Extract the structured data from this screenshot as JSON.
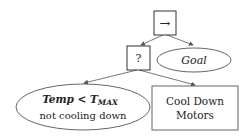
{
  "diagram": {
    "type": "behavior-tree",
    "nodes": {
      "sequence": {
        "label": "→",
        "shape": "box"
      },
      "selector": {
        "label": "?",
        "shape": "box"
      },
      "goal": {
        "label": "Goal",
        "shape": "ellipse"
      },
      "condition": {
        "line1": "Temp < T",
        "subscript": "MAX",
        "line2": "not cooling down",
        "shape": "ellipse"
      },
      "action": {
        "line1": "Cool Down",
        "line2": "Motors",
        "shape": "box"
      }
    },
    "edges": [
      {
        "from": "sequence",
        "to": "selector"
      },
      {
        "from": "sequence",
        "to": "goal"
      },
      {
        "from": "selector",
        "to": "condition"
      },
      {
        "from": "selector",
        "to": "action"
      }
    ],
    "colors": {
      "stroke": "#555555",
      "text": "#222222",
      "background": "#ffffff"
    }
  }
}
